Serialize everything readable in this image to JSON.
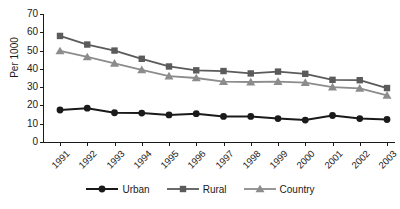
{
  "chart_data": {
    "type": "line",
    "title": "",
    "xlabel": "",
    "ylabel": "Per 1000",
    "ylim": [
      0,
      70
    ],
    "yticks": [
      0,
      10,
      20,
      30,
      40,
      50,
      60,
      70
    ],
    "grid": false,
    "legend_position": "bottom",
    "categories": [
      "1991",
      "1992",
      "1993",
      "1994",
      "1995",
      "1996",
      "1997",
      "1998",
      "1999",
      "2000",
      "2001",
      "2002",
      "2003"
    ],
    "series": [
      {
        "name": "Urban",
        "color": "#1a1a1a",
        "marker": "circle",
        "values": [
          17.5,
          18.5,
          16.0,
          15.8,
          14.8,
          15.5,
          14.0,
          14.0,
          12.8,
          12.0,
          14.5,
          12.8,
          12.3
        ]
      },
      {
        "name": "Rural",
        "color": "#5b5b5b",
        "marker": "square",
        "values": [
          58.0,
          53.3,
          50.0,
          45.5,
          41.3,
          39.2,
          38.8,
          37.5,
          38.5,
          37.3,
          34.0,
          33.8,
          29.5
        ]
      },
      {
        "name": "Country",
        "color": "#8c8c8c",
        "marker": "triangle",
        "values": [
          49.8,
          46.5,
          43.0,
          39.5,
          36.0,
          35.0,
          33.0,
          32.8,
          33.0,
          32.5,
          30.0,
          29.3,
          25.5
        ]
      }
    ]
  },
  "axis": {
    "ylabel": "Per 1000",
    "ytick_labels": [
      "70",
      "60",
      "50",
      "40",
      "30",
      "20",
      "10",
      "0"
    ],
    "xtick_labels": [
      "1991",
      "1992",
      "1993",
      "1994",
      "1995",
      "1996",
      "1997",
      "1998",
      "1999",
      "2000",
      "2001",
      "2002",
      "2003"
    ]
  },
  "legend": {
    "items": [
      {
        "label": "Urban",
        "color": "#1a1a1a",
        "marker": "circle"
      },
      {
        "label": "Rural",
        "color": "#5b5b5b",
        "marker": "square"
      },
      {
        "label": "Country",
        "color": "#8c8c8c",
        "marker": "triangle"
      }
    ]
  },
  "colors": {
    "axis": "#1a1a1a",
    "text": "#1a1a1a",
    "background": "#ffffff",
    "urban": "#1a1a1a",
    "rural": "#5b5b5b",
    "country": "#8c8c8c"
  }
}
